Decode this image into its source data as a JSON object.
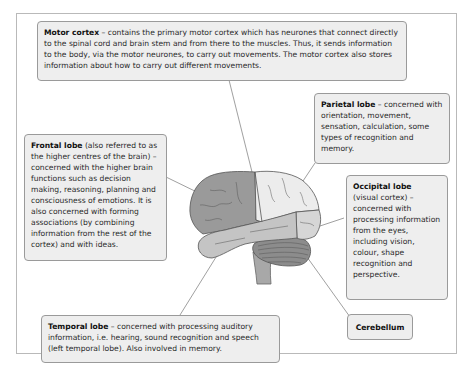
{
  "diagram": {
    "type": "labelled brain diagram",
    "colors": {
      "frontal_lobe": "#9a9a9a",
      "parietal_lobe": "#ececec",
      "occipital_lobe": "#d6d6d6",
      "temporal_lobe": "#c4c4c4",
      "cerebellum": "#8c8c8c",
      "box_fill": "#eeeeee",
      "box_border": "#9a9a9a"
    },
    "labels": {
      "motor_cortex": {
        "title": "Motor cortex",
        "text": " – contains the primary motor cortex which has neurones that connect directly to the spinal cord and brain stem and from there to the muscles. Thus, it sends information to the body, via the motor neurones, to carry out movements. The motor cortex also stores information about how to carry out different movements."
      },
      "parietal_lobe": {
        "title": "Parietal lobe",
        "text": " – concerned with orientation, movement, sensation, calculation, some types of recognition and memory."
      },
      "frontal_lobe": {
        "title": "Frontal lobe",
        "text": " (also referred to as the higher centres of the brain) – concerned with the higher brain functions such as decision making, reasoning, planning and consciousness of emotions. It is also concerned with forming associations (by combining information from the rest of the cortex) and with ideas."
      },
      "occipital_lobe": {
        "title": "Occipital lobe",
        "text": " (visual cortex) – concerned with processing information from the eyes, including vision, colour, shape recognition and perspective."
      },
      "temporal_lobe": {
        "title": "Temporal lobe",
        "text": " – concerned with processing auditory information, i.e. hearing, sound recognition and speech (left temporal lobe). Also involved in memory."
      },
      "cerebellum": {
        "title": "Cerebellum",
        "text": ""
      }
    }
  }
}
